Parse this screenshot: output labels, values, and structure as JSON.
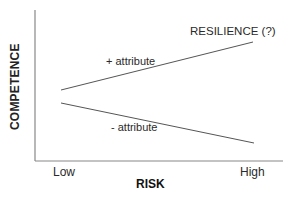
{
  "diagram": {
    "y_axis_label": "COMPETENCE",
    "x_axis_label": "RISK",
    "x_ticks": [
      "Low",
      "High"
    ],
    "lines": [
      {
        "label": "+ attribute",
        "direction": "increasing",
        "annotation": "RESILIENCE (?)"
      },
      {
        "label": "- attribute",
        "direction": "decreasing"
      }
    ],
    "colors": {
      "line": "#555555",
      "axis": "#777777",
      "text": "#222222"
    }
  }
}
